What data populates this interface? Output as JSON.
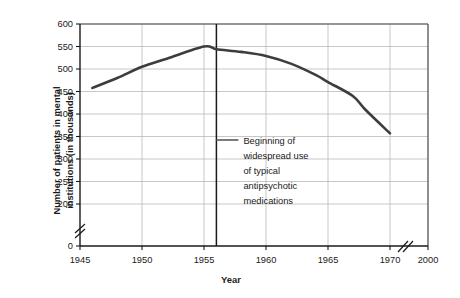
{
  "credit": "© Cengage Learning 2013",
  "chart_data": {
    "type": "line",
    "title": "",
    "xlabel": "Year",
    "ylabel_line1": "Number of patients in mental",
    "ylabel_line2": "institutions (in thousands)",
    "xlim": [
      1945,
      1972
    ],
    "ylim": [
      180,
      600
    ],
    "grid": true,
    "legend": "none",
    "xticks": [
      "1945",
      "1950",
      "1955",
      "1960",
      "1965",
      "1970",
      "2000"
    ],
    "xtick_values": [
      1945,
      1950,
      1955,
      1960,
      1965,
      1970,
      2000
    ],
    "yticks": [
      "0",
      "200",
      "250",
      "300",
      "350",
      "400",
      "450",
      "500",
      "550",
      "600"
    ],
    "ytick_values": [
      0,
      200,
      250,
      300,
      350,
      400,
      450,
      500,
      550,
      600
    ],
    "y_axis_break": true,
    "y_axis_break_between": [
      0,
      200
    ],
    "x_axis_break": true,
    "x_axis_break_between": [
      1970,
      2000
    ],
    "series": [
      {
        "name": "Patients in mental institutions",
        "x": [
          1946,
          1948,
          1950,
          1952,
          1955,
          1956,
          1958,
          1960,
          1962,
          1964,
          1965,
          1967,
          1968,
          1970
        ],
        "values": [
          458,
          480,
          505,
          523,
          550,
          544,
          538,
          529,
          512,
          487,
          471,
          440,
          410,
          357
        ],
        "color": "#3d3d3d"
      }
    ],
    "annotations": [
      {
        "name": "antipsychotic-marker",
        "x": 1956,
        "type": "vline",
        "color": "#1a1a1a",
        "label_lines": [
          "Beginning of",
          "widespread use",
          "of typical",
          "antipsychotic",
          "medications"
        ]
      }
    ]
  }
}
